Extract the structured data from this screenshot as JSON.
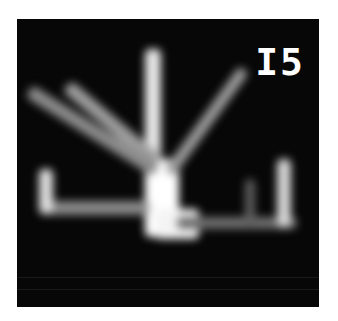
{
  "image": {
    "description": "Blurred grayscale image of a branching bright structure on black background",
    "label": "I5",
    "colors": {
      "background": "#070707",
      "bright": "#ffffff",
      "mid": "#9a9a9a",
      "dim": "#5a5a5a"
    }
  }
}
